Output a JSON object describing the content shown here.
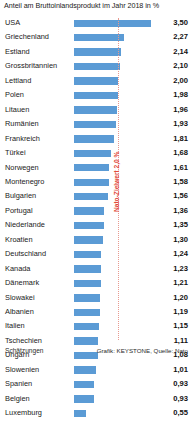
{
  "chart_data": {
    "type": "bar",
    "orientation": "horizontal",
    "title": "Anteil am Bruttoinlandsprodukt im Jahr 2018 in %",
    "xlabel": "",
    "ylabel": "",
    "xlim": [
      0,
      3.6
    ],
    "grid": false,
    "legend": null,
    "bar_color": "#5b9bd5",
    "categories": [
      "USA",
      "Griechenland",
      "Estland",
      "Grossbritannien",
      "Lettland",
      "Polen",
      "Litauen",
      "Rumänien",
      "Frankreich",
      "Türkei",
      "Norwegen",
      "Montenegro",
      "Bulgarien",
      "Portugal",
      "Niederlande",
      "Kroatien",
      "Deutschland",
      "Kanada",
      "Dänemark",
      "Slowakei",
      "Albanien",
      "Italien",
      "Tschechien",
      "Ungarn",
      "Slowenien",
      "Spanien",
      "Belgien",
      "Luxemburg"
    ],
    "values": [
      3.5,
      2.27,
      2.14,
      2.1,
      2.0,
      1.98,
      1.96,
      1.93,
      1.81,
      1.68,
      1.61,
      1.58,
      1.56,
      1.36,
      1.35,
      1.3,
      1.24,
      1.23,
      1.21,
      1.2,
      1.19,
      1.15,
      1.11,
      1.08,
      1.01,
      0.93,
      0.93,
      0.55
    ],
    "value_labels": [
      "3,50",
      "2,27",
      "2,14",
      "2,10",
      "2,00",
      "1,98",
      "1,96",
      "1,93",
      "1,81",
      "1,68",
      "1,61",
      "1,58",
      "1,56",
      "1,36",
      "1,35",
      "1,30",
      "1,24",
      "1,23",
      "1,21",
      "1,20",
      "1,19",
      "1,15",
      "1,11",
      "1,08",
      "1,01",
      "0,93",
      "0,93",
      "0,55"
    ],
    "annotations": [
      {
        "name": "nato-target-line",
        "label": "Nato-Zielwert 2,0 %",
        "value": 2.0,
        "color": "#e24b3c",
        "line_color": "#e8998f",
        "style": "dotted-vertical"
      }
    ]
  },
  "footnote": "Schätzungen",
  "credit": "Grafik: KEYSTONE, Quelle: Nato"
}
